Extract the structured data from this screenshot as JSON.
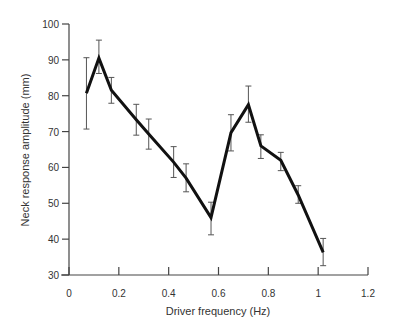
{
  "chart_data": {
    "type": "line",
    "title": "",
    "xlabel": "Driver frequency (Hz)",
    "ylabel": "Neck response amplitude (mm)",
    "xlim": [
      0,
      1.2
    ],
    "ylim": [
      30,
      100
    ],
    "xticks": [
      0,
      0.2,
      0.4,
      0.6,
      0.8,
      1,
      1.2
    ],
    "xtick_labels": [
      "0",
      "0.2",
      "0.4",
      "0.6",
      "0.8",
      "1",
      "1.2"
    ],
    "yticks": [
      30,
      40,
      50,
      60,
      70,
      80,
      90,
      100
    ],
    "ytick_labels": [
      "30",
      "40",
      "50",
      "60",
      "70",
      "80",
      "90",
      "100"
    ],
    "grid": false,
    "legend": null,
    "series": [
      {
        "name": "Neck response",
        "x": [
          0.07,
          0.12,
          0.17,
          0.27,
          0.32,
          0.42,
          0.47,
          0.57,
          0.65,
          0.72,
          0.77,
          0.85,
          0.92,
          1.02
        ],
        "values": [
          80.7,
          90.5,
          81.5,
          73.3,
          69.3,
          61.5,
          57.0,
          46.0,
          69.7,
          77.5,
          66.0,
          62.0,
          52.3,
          36.3
        ],
        "err_low": [
          70.7,
          86.2,
          77.9,
          69.0,
          65.1,
          57.2,
          53.2,
          41.2,
          64.6,
          72.6,
          62.5,
          59.1,
          50.0,
          32.6
        ],
        "err_high": [
          90.6,
          95.5,
          85.1,
          77.6,
          73.5,
          65.8,
          61.0,
          50.3,
          74.7,
          82.7,
          69.1,
          64.2,
          54.9,
          40.2
        ]
      }
    ],
    "colors": {
      "line": "#111111",
      "error_bar": "#555555",
      "axis": "#444444"
    }
  }
}
